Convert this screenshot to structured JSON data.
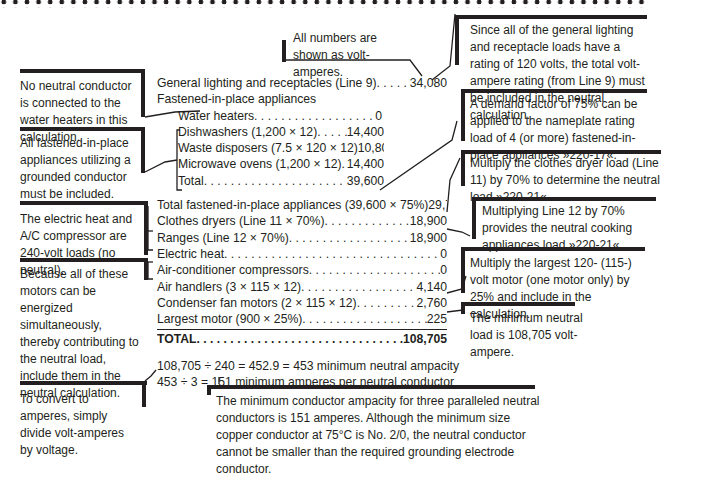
{
  "header_note": "All numbers are shown as volt-amperes.",
  "table": {
    "rows": [
      {
        "label": "General lighting and receptacles (Line 9)",
        "value": "34,080",
        "indent": false
      },
      {
        "label": "Fastened-in-place appliances",
        "value": "",
        "indent": false
      },
      {
        "label": "Water heaters",
        "value": "0",
        "indent": true
      },
      {
        "label": "Dishwashers (1,200 × 12)",
        "value": "14,400",
        "indent": true
      },
      {
        "label": "Waste disposers (7.5 × 120 × 12)",
        "value": "10,800",
        "indent": true
      },
      {
        "label": "Microwave ovens (1,200 × 12)",
        "value": "14,400",
        "indent": true
      },
      {
        "label": "Total",
        "value": "39,600",
        "indent": true
      },
      {
        "label": "Total fastened-in-place appliances (39,600 × 75%)",
        "value": "29,700",
        "indent": false
      },
      {
        "label": "Clothes dryers (Line 11 × 70%)",
        "value": "18,900",
        "indent": false
      },
      {
        "label": "Ranges (Line 12 × 70%)",
        "value": "18,900",
        "indent": false
      },
      {
        "label": "Electric heat",
        "value": "0",
        "indent": false
      },
      {
        "label": "Air-conditioner compressors",
        "value": "0",
        "indent": false
      },
      {
        "label": "Air handlers (3 × 115 × 12)",
        "value": "4,140",
        "indent": false
      },
      {
        "label": "Condenser fan motors (2 × 115 × 12)",
        "value": "2,760",
        "indent": false
      },
      {
        "label": "Largest motor (900 × 25%)",
        "value": "225",
        "indent": false
      }
    ],
    "total": {
      "label": "TOTAL",
      "value": "108,705"
    }
  },
  "calculations": [
    "108,705 ÷ 240 = 452.9 = 453 minimum neutral ampacity",
    "453 ÷ 3 = 151 minimum amperes per neutral conductor"
  ],
  "left_notes": [
    "No neutral conductor is connected to the water heaters in this calculation.",
    "All fastened-in-place appliances utilizing a grounded conductor must be included.",
    "The electric heat and A/C compressor are 240-volt loads (no neutral).",
    "Because all of these motors can be energized simultaneously, thereby contributing to the neutral load, include them in the neutral calculation.",
    "To convert to amperes, simply divide volt-amperes by voltage."
  ],
  "right_notes": [
    "Since all of the general lighting and receptacle loads have a rating of 120 volts, the total volt-ampere rating (from Line 9) must be included in the neutral calculation.",
    "A demand factor of 75% can be applied to the nameplate rating load of 4 (or more) fastened-in-place appliances »220-17«.",
    "Multiply the clothes dryer load (Line 11) by 70% to determine the neutral load »220-21«.",
    "Multiplying Line 12 by 70% provides the neutral cooking appliances load »220-21«.",
    "Multiply the largest 120- (115-) volt motor (one motor only) by 25% and include in the calculation.",
    "The minimum neutral load is 108,705 volt-ampere."
  ],
  "bottom_note": "The minimum conductor ampacity for three paralleled neutral conductors is 151 amperes. Although the minimum size copper conductor at 75°C is No. 2/0, the neutral conductor cannot be smaller than the required grounding electrode conductor."
}
